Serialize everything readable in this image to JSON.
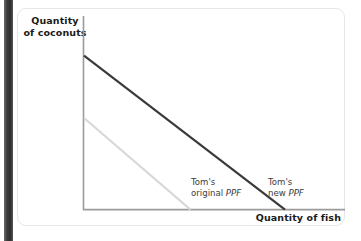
{
  "figure": {
    "y_axis_label": "Quantity\nof coconuts",
    "x_axis_label": "Quantity of fish",
    "original_ppf_label": "Tom's\noriginal PPF",
    "new_ppf_label": "Tom's\nnew PPF"
  },
  "colors": {
    "new_ppf_line": "#3a3a3a",
    "original_ppf_line": "#d8d8d8",
    "axis": "#9b9b9b",
    "text": "#1a1a1a",
    "label_text": "#3d3d3d",
    "card_border": "#e6e6e6",
    "gutter_bar": "#2e2e2e",
    "background": "#ffffff"
  },
  "chart_data": {
    "type": "line",
    "title": "",
    "subtitle": "",
    "xlabel": "Quantity of fish",
    "ylabel": "Quantity of coconuts",
    "grid": false,
    "legend_position": "inline-annotations",
    "axis_ranges": {
      "x": [
        0,
        100
      ],
      "y": [
        0,
        100
      ]
    },
    "axis_ticks": {
      "x": [],
      "y": []
    },
    "series": [
      {
        "name": "Tom's original PPF",
        "style": "solid-light",
        "color": "#d8d8d8",
        "x": [
          0,
          53
        ],
        "y": [
          47,
          0
        ],
        "annotation": "Tom's original PPF"
      },
      {
        "name": "Tom's new PPF",
        "style": "solid-dark",
        "color": "#3a3a3a",
        "x": [
          0,
          100
        ],
        "y": [
          79,
          0
        ],
        "annotation": "Tom's new PPF"
      }
    ],
    "annotations": [
      {
        "text": "Tom's original PPF",
        "x": 45,
        "y": 14
      },
      {
        "text": "Tom's new PPF",
        "x": 83,
        "y": 14
      }
    ]
  }
}
